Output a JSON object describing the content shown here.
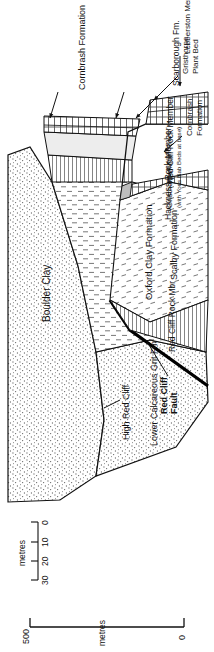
{
  "figure": {
    "kind": "geological-cross-section",
    "orientation": "rotated-90-ccw"
  },
  "scales": {
    "vertical": {
      "label": "metres",
      "top_value": "500",
      "bottom_value": "0"
    },
    "horizontal": {
      "label": "metres",
      "ticks": [
        "30",
        "20",
        "10",
        "0"
      ]
    }
  },
  "locality": {
    "cliff_label": "High Red Cliff"
  },
  "structures": {
    "fault_line1": "Red Cliff",
    "fault_line2": "Fault"
  },
  "units": {
    "boulder_clay": "Boulder Clay",
    "lower_calcareous_grit": "Lower Calcareous Grit Fm",
    "oxford_clay": "Oxford Clay Formation",
    "hackness_rock": "Hackness Rock Member",
    "red_cliff_rock_member": "Red Cliff Rock Member",
    "red_cliff_rock_mbr": "Red Cliff Rock Mbr",
    "cornbrash_right": "Cornbrash Formation",
    "cornbrash_left_l1": "Cornbrash",
    "cornbrash_left_l2": "Formation",
    "scalby": "Scalby Formation",
    "gristhorpe_mbr": "Gristhorpe Mbr",
    "gristhorpe_note": "(with Yons Nab Beds at base)",
    "scarborough": "Scarborough Fm.",
    "gristhorpe_plant_l1": "Gristhorpe",
    "gristhorpe_plant_l2": "Plant Bed",
    "lebberston": "Lebberston Member (Millepore Bed)"
  },
  "colors": {
    "ink": "#111111",
    "stipple": "#6d6d6d",
    "pale_fill": "#ededed"
  }
}
